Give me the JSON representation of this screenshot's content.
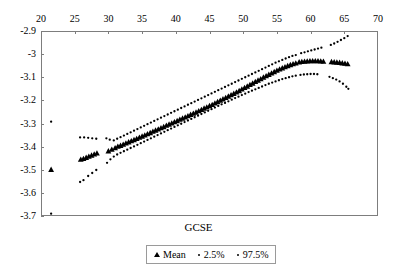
{
  "chart_data": {
    "type": "scatter",
    "title": "",
    "xlabel": "GCSE",
    "ylabel": "",
    "xlim": [
      20,
      70
    ],
    "ylim": [
      -3.7,
      -2.9
    ],
    "xticks": [
      20,
      25,
      30,
      35,
      40,
      45,
      50,
      55,
      60,
      65,
      70
    ],
    "xtick_labels": [
      "20",
      "25",
      "30",
      "35",
      "40",
      "45",
      "50",
      "55",
      "60",
      "65",
      "70"
    ],
    "yticks": [
      -2.9,
      -3,
      -3.1,
      -3.2,
      -3.3,
      -3.4,
      -3.5,
      -3.6,
      -3.7
    ],
    "ytick_labels": [
      "-2.9",
      "-3",
      "-3.1",
      "-3.2",
      "-3.3",
      "-3.4",
      "-3.5",
      "-3.6",
      "-3.7"
    ],
    "grid": false,
    "x_axis_position": "top",
    "legend_position": "bottom",
    "series": [
      {
        "name": "Mean",
        "marker": "triangle",
        "color": "#000000",
        "points": [
          [
            21.5,
            -3.499
          ],
          [
            25.9,
            -3.455
          ],
          [
            26.3,
            -3.452
          ],
          [
            26.7,
            -3.447
          ],
          [
            27.1,
            -3.442
          ],
          [
            27.5,
            -3.437
          ],
          [
            27.9,
            -3.432
          ],
          [
            28.3,
            -3.428
          ],
          [
            30.0,
            -3.419
          ],
          [
            30.5,
            -3.412
          ],
          [
            31.0,
            -3.405
          ],
          [
            31.4,
            -3.399
          ],
          [
            31.8,
            -3.395
          ],
          [
            32.2,
            -3.39
          ],
          [
            32.6,
            -3.385
          ],
          [
            33.0,
            -3.38
          ],
          [
            33.4,
            -3.375
          ],
          [
            33.8,
            -3.37
          ],
          [
            34.2,
            -3.365
          ],
          [
            34.6,
            -3.36
          ],
          [
            35.0,
            -3.355
          ],
          [
            35.4,
            -3.35
          ],
          [
            35.8,
            -3.345
          ],
          [
            36.2,
            -3.34
          ],
          [
            36.6,
            -3.334
          ],
          [
            37.0,
            -3.329
          ],
          [
            37.4,
            -3.324
          ],
          [
            37.8,
            -3.319
          ],
          [
            38.2,
            -3.314
          ],
          [
            38.6,
            -3.308
          ],
          [
            39.0,
            -3.303
          ],
          [
            39.4,
            -3.298
          ],
          [
            39.8,
            -3.293
          ],
          [
            40.2,
            -3.288
          ],
          [
            40.6,
            -3.282
          ],
          [
            41.0,
            -3.277
          ],
          [
            41.4,
            -3.272
          ],
          [
            41.8,
            -3.267
          ],
          [
            42.2,
            -3.261
          ],
          [
            42.6,
            -3.256
          ],
          [
            43.0,
            -3.251
          ],
          [
            43.4,
            -3.245
          ],
          [
            43.8,
            -3.24
          ],
          [
            44.2,
            -3.234
          ],
          [
            44.6,
            -3.229
          ],
          [
            45.0,
            -3.223
          ],
          [
            45.4,
            -3.218
          ],
          [
            45.8,
            -3.212
          ],
          [
            46.2,
            -3.206
          ],
          [
            46.6,
            -3.2
          ],
          [
            47.0,
            -3.194
          ],
          [
            47.4,
            -3.188
          ],
          [
            47.8,
            -3.182
          ],
          [
            48.2,
            -3.176
          ],
          [
            48.6,
            -3.17
          ],
          [
            49.0,
            -3.164
          ],
          [
            49.4,
            -3.158
          ],
          [
            49.8,
            -3.151
          ],
          [
            50.2,
            -3.145
          ],
          [
            50.6,
            -3.139
          ],
          [
            51.0,
            -3.132
          ],
          [
            51.4,
            -3.126
          ],
          [
            51.8,
            -3.119
          ],
          [
            52.2,
            -3.113
          ],
          [
            52.6,
            -3.107
          ],
          [
            53.0,
            -3.1
          ],
          [
            53.4,
            -3.094
          ],
          [
            53.8,
            -3.088
          ],
          [
            54.2,
            -3.082
          ],
          [
            54.6,
            -3.076
          ],
          [
            55.0,
            -3.07
          ],
          [
            55.4,
            -3.065
          ],
          [
            55.8,
            -3.06
          ],
          [
            56.2,
            -3.055
          ],
          [
            56.6,
            -3.05
          ],
          [
            57.0,
            -3.046
          ],
          [
            57.4,
            -3.042
          ],
          [
            57.8,
            -3.039
          ],
          [
            58.3,
            -3.034
          ],
          [
            58.7,
            -3.032
          ],
          [
            59.1,
            -3.031
          ],
          [
            59.5,
            -3.03
          ],
          [
            59.9,
            -3.029
          ],
          [
            60.3,
            -3.029
          ],
          [
            60.7,
            -3.029
          ],
          [
            61.1,
            -3.029
          ],
          [
            61.5,
            -3.03
          ],
          [
            61.9,
            -3.031
          ],
          [
            63.1,
            -3.033
          ],
          [
            63.5,
            -3.034
          ],
          [
            63.9,
            -3.035
          ],
          [
            64.3,
            -3.036
          ],
          [
            64.7,
            -3.038
          ],
          [
            65.1,
            -3.04
          ],
          [
            65.5,
            -3.042
          ]
        ]
      },
      {
        "name": "2.5%",
        "marker": "dot",
        "color": "#000000",
        "points": [
          [
            21.5,
            -3.69
          ],
          [
            25.8,
            -3.553
          ],
          [
            26.3,
            -3.545
          ],
          [
            27.0,
            -3.527
          ],
          [
            27.6,
            -3.514
          ],
          [
            28.2,
            -3.501
          ],
          [
            29.8,
            -3.47
          ],
          [
            30.3,
            -3.455
          ],
          [
            30.8,
            -3.443
          ],
          [
            31.3,
            -3.434
          ],
          [
            31.8,
            -3.427
          ],
          [
            32.3,
            -3.42
          ],
          [
            32.8,
            -3.413
          ],
          [
            33.3,
            -3.406
          ],
          [
            33.8,
            -3.399
          ],
          [
            34.3,
            -3.392
          ],
          [
            34.8,
            -3.385
          ],
          [
            35.3,
            -3.378
          ],
          [
            35.8,
            -3.371
          ],
          [
            36.3,
            -3.364
          ],
          [
            36.8,
            -3.357
          ],
          [
            37.3,
            -3.35
          ],
          [
            37.8,
            -3.343
          ],
          [
            38.3,
            -3.336
          ],
          [
            38.8,
            -3.329
          ],
          [
            39.3,
            -3.322
          ],
          [
            39.8,
            -3.315
          ],
          [
            40.3,
            -3.308
          ],
          [
            40.8,
            -3.301
          ],
          [
            41.3,
            -3.294
          ],
          [
            41.8,
            -3.287
          ],
          [
            42.3,
            -3.28
          ],
          [
            42.8,
            -3.273
          ],
          [
            43.3,
            -3.266
          ],
          [
            43.8,
            -3.259
          ],
          [
            44.3,
            -3.252
          ],
          [
            44.8,
            -3.245
          ],
          [
            45.3,
            -3.238
          ],
          [
            45.8,
            -3.231
          ],
          [
            46.3,
            -3.224
          ],
          [
            46.8,
            -3.217
          ],
          [
            47.3,
            -3.211
          ],
          [
            47.8,
            -3.204
          ],
          [
            48.3,
            -3.197
          ],
          [
            48.8,
            -3.19
          ],
          [
            49.3,
            -3.184
          ],
          [
            49.8,
            -3.177
          ],
          [
            50.3,
            -3.171
          ],
          [
            50.8,
            -3.164
          ],
          [
            51.3,
            -3.158
          ],
          [
            51.8,
            -3.152
          ],
          [
            52.3,
            -3.146
          ],
          [
            52.8,
            -3.14
          ],
          [
            53.3,
            -3.134
          ],
          [
            53.8,
            -3.128
          ],
          [
            54.3,
            -3.123
          ],
          [
            54.8,
            -3.118
          ],
          [
            55.3,
            -3.113
          ],
          [
            55.8,
            -3.108
          ],
          [
            56.3,
            -3.104
          ],
          [
            56.8,
            -3.1
          ],
          [
            57.3,
            -3.096
          ],
          [
            57.8,
            -3.093
          ],
          [
            58.5,
            -3.09
          ],
          [
            59.0,
            -3.088
          ],
          [
            59.5,
            -3.087
          ],
          [
            60.0,
            -3.086
          ],
          [
            60.5,
            -3.086
          ],
          [
            61.0,
            -3.087
          ],
          [
            62.8,
            -3.098
          ],
          [
            63.3,
            -3.104
          ],
          [
            63.8,
            -3.11
          ],
          [
            64.3,
            -3.118
          ],
          [
            64.8,
            -3.128
          ],
          [
            65.3,
            -3.141
          ],
          [
            65.6,
            -3.15
          ]
        ]
      },
      {
        "name": "97.5%",
        "marker": "dot",
        "color": "#000000",
        "points": [
          [
            21.5,
            -3.292
          ],
          [
            25.8,
            -3.36
          ],
          [
            26.4,
            -3.36
          ],
          [
            27.0,
            -3.362
          ],
          [
            27.6,
            -3.364
          ],
          [
            28.2,
            -3.366
          ],
          [
            29.7,
            -3.364
          ],
          [
            30.2,
            -3.37
          ],
          [
            30.8,
            -3.373
          ],
          [
            31.3,
            -3.366
          ],
          [
            31.8,
            -3.359
          ],
          [
            32.3,
            -3.352
          ],
          [
            32.8,
            -3.345
          ],
          [
            33.3,
            -3.338
          ],
          [
            33.8,
            -3.331
          ],
          [
            34.3,
            -3.324
          ],
          [
            34.8,
            -3.317
          ],
          [
            35.3,
            -3.31
          ],
          [
            35.8,
            -3.303
          ],
          [
            36.3,
            -3.296
          ],
          [
            36.8,
            -3.289
          ],
          [
            37.3,
            -3.282
          ],
          [
            37.8,
            -3.275
          ],
          [
            38.3,
            -3.268
          ],
          [
            38.8,
            -3.261
          ],
          [
            39.3,
            -3.254
          ],
          [
            39.8,
            -3.247
          ],
          [
            40.3,
            -3.24
          ],
          [
            40.8,
            -3.233
          ],
          [
            41.3,
            -3.226
          ],
          [
            41.8,
            -3.219
          ],
          [
            42.3,
            -3.212
          ],
          [
            42.8,
            -3.205
          ],
          [
            43.3,
            -3.198
          ],
          [
            43.8,
            -3.191
          ],
          [
            44.3,
            -3.184
          ],
          [
            44.8,
            -3.177
          ],
          [
            45.3,
            -3.17
          ],
          [
            45.8,
            -3.163
          ],
          [
            46.3,
            -3.156
          ],
          [
            46.8,
            -3.149
          ],
          [
            47.3,
            -3.142
          ],
          [
            47.8,
            -3.135
          ],
          [
            48.3,
            -3.128
          ],
          [
            48.8,
            -3.121
          ],
          [
            49.3,
            -3.114
          ],
          [
            49.8,
            -3.107
          ],
          [
            50.3,
            -3.1
          ],
          [
            50.8,
            -3.093
          ],
          [
            51.3,
            -3.086
          ],
          [
            51.8,
            -3.079
          ],
          [
            52.3,
            -3.072
          ],
          [
            52.8,
            -3.065
          ],
          [
            53.3,
            -3.058
          ],
          [
            53.8,
            -3.051
          ],
          [
            54.3,
            -3.044
          ],
          [
            54.8,
            -3.037
          ],
          [
            55.3,
            -3.031
          ],
          [
            55.8,
            -3.025
          ],
          [
            56.3,
            -3.019
          ],
          [
            56.8,
            -3.013
          ],
          [
            57.3,
            -3.008
          ],
          [
            57.8,
            -3.004
          ],
          [
            58.6,
            -2.996
          ],
          [
            59.1,
            -2.992
          ],
          [
            59.6,
            -2.988
          ],
          [
            60.1,
            -2.984
          ],
          [
            60.6,
            -2.98
          ],
          [
            61.1,
            -2.976
          ],
          [
            61.6,
            -2.972
          ],
          [
            63.0,
            -2.96
          ],
          [
            63.5,
            -2.954
          ],
          [
            64.0,
            -2.947
          ],
          [
            64.5,
            -2.939
          ],
          [
            65.0,
            -2.931
          ],
          [
            65.5,
            -2.922
          ]
        ]
      }
    ]
  },
  "legend": {
    "entries": [
      {
        "label": "Mean",
        "marker": "triangle"
      },
      {
        "label": "2.5%",
        "marker": "dot"
      },
      {
        "label": "97.5%",
        "marker": "dot"
      }
    ]
  }
}
